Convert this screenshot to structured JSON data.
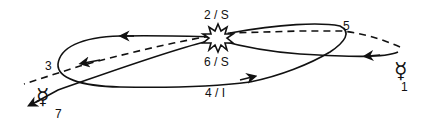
{
  "diagram": {
    "type": "orbital-trajectory",
    "colors": {
      "stroke": "#111111",
      "background": "#ffffff"
    },
    "symbols": {
      "start_planet": {
        "glyph": "☿",
        "name": "mercury-symbol",
        "label": "1"
      },
      "end_planet": {
        "glyph": "☿",
        "name": "mercury-symbol",
        "label": "7"
      },
      "event": {
        "name": "starburst-icon"
      }
    },
    "labels": {
      "point1": "1",
      "point2": "2 / S",
      "point3": "3",
      "point4": "4 / I",
      "point5": "5",
      "point6": "6 / S",
      "point7": "7"
    },
    "paths": {
      "reference_line": "dashed",
      "trajectory": "solid"
    }
  }
}
